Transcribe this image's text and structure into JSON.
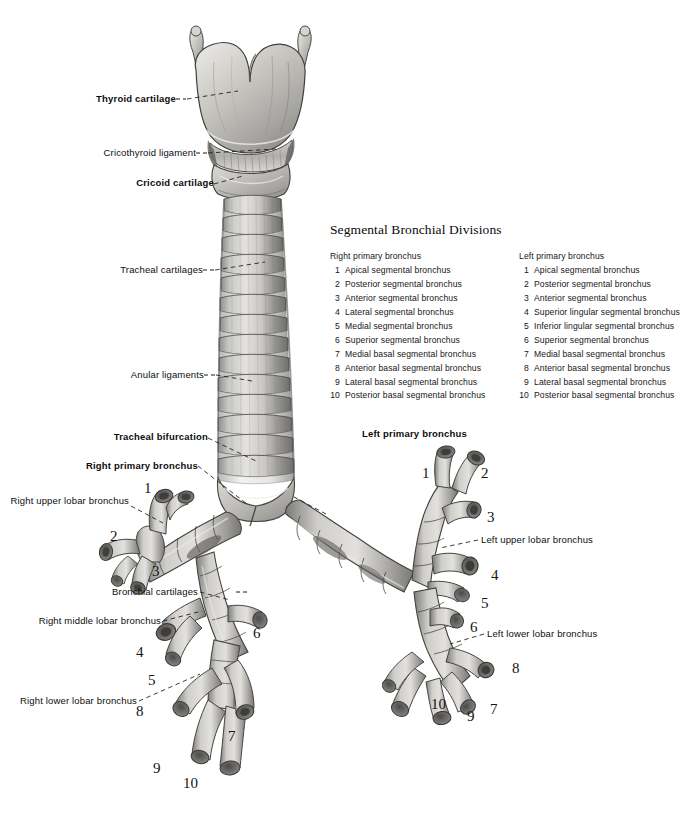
{
  "figure": {
    "background_color": "#ffffff",
    "ink_color": "#111111"
  },
  "legend": {
    "title": "Segmental Bronchial Divisions",
    "columns": [
      {
        "heading": "Right primary bronchus",
        "items": [
          {
            "index": "1",
            "label": "Apical segmental bronchus"
          },
          {
            "index": "2",
            "label": "Posterior segmental bronchus"
          },
          {
            "index": "3",
            "label": "Anterior segmental bronchus"
          },
          {
            "index": "4",
            "label": "Lateral segmental bronchus"
          },
          {
            "index": "5",
            "label": "Medial segmental bronchus"
          },
          {
            "index": "6",
            "label": "Superior segmental bronchus"
          },
          {
            "index": "7",
            "label": "Medial basal segmental bronchus"
          },
          {
            "index": "8",
            "label": "Anterior basal segmental bronchus"
          },
          {
            "index": "9",
            "label": "Lateral basal segmental bronchus"
          },
          {
            "index": "10",
            "label": "Posterior basal segmental bronchus"
          }
        ]
      },
      {
        "heading": "Left primary bronchus",
        "items": [
          {
            "index": "1",
            "label": "Apical segmental bronchus"
          },
          {
            "index": "2",
            "label": "Posterior segmental bronchus"
          },
          {
            "index": "3",
            "label": "Anterior segmental bronchus"
          },
          {
            "index": "4",
            "label": "Superior lingular segmental bronchus"
          },
          {
            "index": "5",
            "label": "Inferior lingular segmental bronchus"
          },
          {
            "index": "6",
            "label": "Superior segmental bronchus"
          },
          {
            "index": "7",
            "label": "Medial basal segmental bronchus"
          },
          {
            "index": "8",
            "label": "Anterior basal segmental bronchus"
          },
          {
            "index": "9",
            "label": "Lateral basal segmental bronchus"
          },
          {
            "index": "10",
            "label": "Posterior basal segmental bronchus"
          }
        ]
      }
    ]
  },
  "callout_labels": {
    "thyroid_cartilage": "Thyroid cartilage",
    "cricothyroid_ligament": "Cricothyroid ligament",
    "cricoid_cartilage": "Cricoid cartilage",
    "tracheal_cartilages": "Tracheal cartilages",
    "anular_ligaments": "Anular ligaments",
    "tracheal_bifurcation": "Tracheal bifurcation",
    "right_primary_bronchus": "Right primary bronchus",
    "left_primary_bronchus": "Left primary bronchus",
    "right_upper_lobar_bronchus": "Right upper lobar bronchus",
    "bronchial_cartilages": "Bronchial cartilages",
    "right_middle_lobar_bronchus": "Right middle lobar bronchus",
    "right_lower_lobar_bronchus": "Right lower lobar bronchus",
    "left_upper_lobar_bronchus": "Left upper lobar bronchus",
    "left_lower_lobar_bronchus": "Left lower lobar bronchus"
  },
  "numeric_callouts": {
    "right_lung": [
      {
        "n": "1",
        "x": 144,
        "y": 481
      },
      {
        "n": "2",
        "x": 110,
        "y": 529
      },
      {
        "n": "3",
        "x": 152,
        "y": 564
      },
      {
        "n": "4",
        "x": 136,
        "y": 645
      },
      {
        "n": "5",
        "x": 148,
        "y": 673
      },
      {
        "n": "6",
        "x": 253,
        "y": 626
      },
      {
        "n": "7",
        "x": 228,
        "y": 729
      },
      {
        "n": "8",
        "x": 136,
        "y": 704
      },
      {
        "n": "9",
        "x": 153,
        "y": 761
      },
      {
        "n": "10",
        "x": 183,
        "y": 776
      }
    ],
    "left_lung": [
      {
        "n": "1",
        "x": 422,
        "y": 466
      },
      {
        "n": "2",
        "x": 481,
        "y": 466
      },
      {
        "n": "3",
        "x": 487,
        "y": 510
      },
      {
        "n": "4",
        "x": 491,
        "y": 568
      },
      {
        "n": "5",
        "x": 481,
        "y": 596
      },
      {
        "n": "6",
        "x": 470,
        "y": 620
      },
      {
        "n": "7",
        "x": 490,
        "y": 702
      },
      {
        "n": "8",
        "x": 512,
        "y": 661
      },
      {
        "n": "9",
        "x": 467,
        "y": 709
      },
      {
        "n": "10",
        "x": 431,
        "y": 697
      }
    ]
  }
}
